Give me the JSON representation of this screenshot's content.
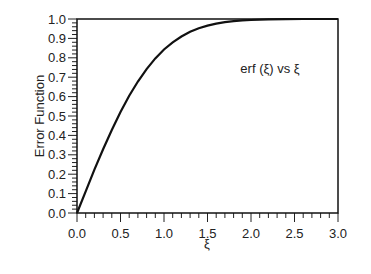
{
  "chart_data": {
    "type": "line",
    "title": "",
    "annotation": "erf (ξ) vs ξ",
    "xlabel": "ξ",
    "ylabel": "Error Function",
    "xlim": [
      0.0,
      3.0
    ],
    "ylim": [
      0.0,
      1.0
    ],
    "x_ticks": [
      "0.0",
      "0.5",
      "1.0",
      "1.5",
      "2.0",
      "2.5",
      "3.0"
    ],
    "y_ticks": [
      "0.0",
      "0.1",
      "0.2",
      "0.3",
      "0.4",
      "0.5",
      "0.6",
      "0.7",
      "0.8",
      "0.9",
      "1.0"
    ],
    "grid": false,
    "legend": null,
    "series": [
      {
        "name": "erf(ξ)",
        "x": [
          0.0,
          0.1,
          0.2,
          0.3,
          0.4,
          0.5,
          0.6,
          0.7,
          0.8,
          0.9,
          1.0,
          1.1,
          1.2,
          1.3,
          1.4,
          1.5,
          1.6,
          1.7,
          1.8,
          1.9,
          2.0,
          2.2,
          2.4,
          2.6,
          2.8,
          3.0
        ],
        "values": [
          0.0,
          0.112,
          0.223,
          0.329,
          0.428,
          0.521,
          0.604,
          0.678,
          0.742,
          0.797,
          0.843,
          0.88,
          0.91,
          0.934,
          0.952,
          0.966,
          0.976,
          0.984,
          0.989,
          0.993,
          0.995,
          0.998,
          0.999,
          1.0,
          1.0,
          1.0
        ]
      }
    ]
  }
}
